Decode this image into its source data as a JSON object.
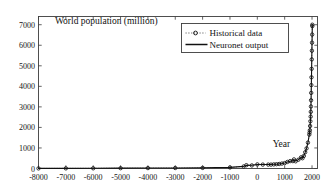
{
  "chart_data": {
    "type": "line",
    "title": "World population (million)",
    "xlabel": "Year",
    "ylabel": "",
    "grid": false,
    "legend_position": "top-right",
    "xlim": [
      -8000,
      2200
    ],
    "ylim": [
      0,
      7400
    ],
    "xticks": [
      -8000,
      -7000,
      -6000,
      -5000,
      -4000,
      -3000,
      -2000,
      -1000,
      0,
      1000,
      2000
    ],
    "xtick_labels": [
      "-8000",
      "-7000",
      "-6000",
      "-5000",
      "-4000",
      "-3000",
      "-2000",
      "-1000",
      "0",
      "1000",
      "2000"
    ],
    "yticks": [
      0,
      1000,
      2000,
      3000,
      4000,
      5000,
      6000,
      7000
    ],
    "ytick_labels": [
      "0",
      "1000",
      "2000",
      "3000",
      "4000",
      "5000",
      "6000",
      "7000"
    ],
    "annotations": [
      {
        "text": "World population (million)",
        "x": -7400,
        "y": 7050,
        "name": "chart-title-annotation"
      },
      {
        "text": "Year",
        "x": 560,
        "y": 1050,
        "name": "x-axis-label-annotation"
      }
    ],
    "series": [
      {
        "name": "Historical data",
        "style": "dotted-with-circle-markers",
        "marker": "circle",
        "x": [
          -8000,
          -7000,
          -6000,
          -5000,
          -4000,
          -3000,
          -2000,
          -1000,
          -500,
          -400,
          -200,
          1,
          200,
          400,
          500,
          600,
          700,
          800,
          900,
          1000,
          1100,
          1200,
          1300,
          1340,
          1400,
          1500,
          1600,
          1650,
          1700,
          1750,
          1800,
          1850,
          1900,
          1910,
          1920,
          1930,
          1940,
          1950,
          1955,
          1960,
          1965,
          1970,
          1975,
          1980,
          1985,
          1990,
          1995,
          2000,
          2005,
          2010,
          2011
        ],
        "y": [
          5,
          7,
          10,
          15,
          20,
          25,
          30,
          50,
          100,
          162,
          150,
          200,
          190,
          190,
          190,
          200,
          210,
          220,
          240,
          265,
          320,
          360,
          360,
          443,
          350,
          425,
          545,
          500,
          610,
          790,
          980,
          1260,
          1650,
          1750,
          1860,
          2070,
          2300,
          2525,
          2758,
          3018,
          3322,
          3682,
          4061,
          4440,
          4853,
          5310,
          5735,
          6127,
          6520,
          6930,
          7000
        ]
      },
      {
        "name": "Neuronet output",
        "style": "solid",
        "marker": "none",
        "x": [
          -8000,
          -7000,
          -6000,
          -5000,
          -4000,
          -3000,
          -2000,
          -1000,
          -500,
          -400,
          -200,
          1,
          200,
          400,
          500,
          600,
          700,
          800,
          900,
          1000,
          1100,
          1200,
          1300,
          1340,
          1400,
          1500,
          1600,
          1650,
          1700,
          1750,
          1800,
          1850,
          1900,
          1910,
          1920,
          1930,
          1940,
          1950,
          1955,
          1960,
          1965,
          1970,
          1975,
          1980,
          1985,
          1990,
          1995,
          2000,
          2005,
          2010,
          2011
        ],
        "y": [
          6,
          8,
          11,
          16,
          21,
          26,
          33,
          55,
          105,
          150,
          155,
          195,
          192,
          193,
          195,
          205,
          212,
          225,
          242,
          270,
          315,
          355,
          370,
          420,
          365,
          430,
          535,
          515,
          615,
          785,
          985,
          1255,
          1645,
          1755,
          1865,
          2075,
          2305,
          2520,
          2760,
          3020,
          3325,
          3685,
          4060,
          4445,
          4855,
          5305,
          5740,
          6130,
          6525,
          6935,
          7010
        ]
      }
    ]
  },
  "legend": {
    "items": [
      {
        "label": "Historical data",
        "style": "dotted-circle"
      },
      {
        "label": "Neuronet output",
        "style": "solid"
      }
    ]
  },
  "colors": {
    "axis": "#3c3c3c",
    "line_solid": "#111111",
    "line_dotted": "#555555",
    "text": "#111111",
    "background": "#ffffff"
  }
}
